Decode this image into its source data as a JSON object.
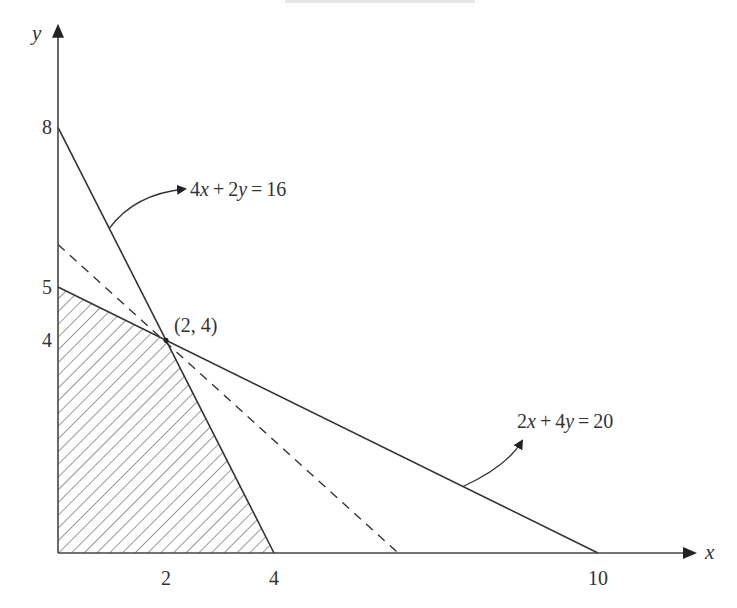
{
  "chart_data": {
    "type": "line",
    "title": "",
    "xlabel": "x",
    "ylabel": "y",
    "xlim": [
      0,
      11.5
    ],
    "ylim": [
      0,
      9.8
    ],
    "grid": false,
    "x_ticks": [
      {
        "value": 2,
        "label": "2"
      },
      {
        "value": 4,
        "label": "4"
      },
      {
        "value": 10,
        "label": "10"
      }
    ],
    "y_ticks": [
      {
        "value": 8,
        "label": "8"
      },
      {
        "value": 5,
        "label": "5"
      },
      {
        "value": 4,
        "label": "4"
      }
    ],
    "series": [
      {
        "name": "4x+2y=16",
        "style": "solid",
        "points": [
          [
            0,
            8
          ],
          [
            4,
            0
          ]
        ]
      },
      {
        "name": "2x+4y=20",
        "style": "solid",
        "points": [
          [
            0,
            5
          ],
          [
            10,
            0
          ]
        ]
      },
      {
        "name": "objective (iso-line through optimum)",
        "style": "dashed",
        "points": [
          [
            0,
            5.8
          ],
          [
            6.3,
            0
          ]
        ]
      }
    ],
    "feasible_region": {
      "style": "hatched",
      "vertices": [
        [
          0,
          0
        ],
        [
          0,
          5
        ],
        [
          2,
          4
        ],
        [
          4,
          0
        ]
      ]
    },
    "point_annotations": [
      {
        "x": 2,
        "y": 4,
        "label": "(2,  4)"
      }
    ],
    "line_annotations": [
      {
        "label_parts": [
          {
            "t": "4",
            "i": false
          },
          {
            "t": "x",
            "i": true
          },
          {
            "t": "+2",
            "i": false
          },
          {
            "t": "y",
            "i": true
          },
          {
            "t": "=16",
            "i": false
          }
        ],
        "text": "4x+2y=16",
        "target_series": "4x+2y=16"
      },
      {
        "label_parts": [
          {
            "t": "2",
            "i": false
          },
          {
            "t": "x",
            "i": true
          },
          {
            "t": "+4",
            "i": false
          },
          {
            "t": "y",
            "i": true
          },
          {
            "t": "=20",
            "i": false
          }
        ],
        "text": "2x+4y=20",
        "target_series": "2x+4y=20"
      }
    ],
    "colors": {
      "axis": "#333333",
      "line": "#333333",
      "hatch": "#555555",
      "text": "#333333"
    }
  }
}
